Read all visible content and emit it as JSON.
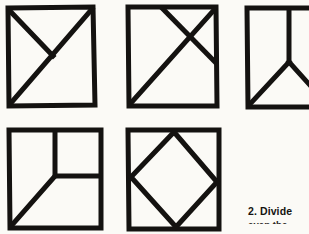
{
  "page": {
    "background_color": "#fbfaf6",
    "ink_color": "#141210",
    "width": 309,
    "height": 234
  },
  "caption": {
    "line_1": "2. Divide",
    "line_2": "even the piece"
  },
  "figures": [
    {
      "id": "figure-1",
      "name": "square-diagonal-and-half-diagonal",
      "row": 1,
      "column": 1,
      "description": "Square with full diagonal from bottom-left to top-right and a short diagonal from top-left to center",
      "clipped": false
    },
    {
      "id": "figure-2",
      "name": "square-two-parallel-diagonals",
      "row": 1,
      "column": 2,
      "description": "Square with full diagonal from bottom-left to top-right plus a parallel diagonal cutting the upper-right corner",
      "clipped": false
    },
    {
      "id": "figure-3",
      "name": "square-y-division",
      "row": 1,
      "column": 3,
      "description": "Square divided by a Y shape: vertical line from top edge to center, then two lines to the bottom-left and bottom-right corners",
      "clipped": true
    },
    {
      "id": "figure-4",
      "name": "square-inner-square-and-diagonal",
      "row": 2,
      "column": 1,
      "description": "Square with an inset square in the upper-right quadrant and a diagonal from its inner corner to the bottom-left corner",
      "clipped": false
    },
    {
      "id": "figure-5",
      "name": "square-inscribed-diamond",
      "row": 2,
      "column": 2,
      "description": "Square with an inscribed rotated square (diamond) touching the midpoints of all four sides",
      "clipped": false
    }
  ]
}
